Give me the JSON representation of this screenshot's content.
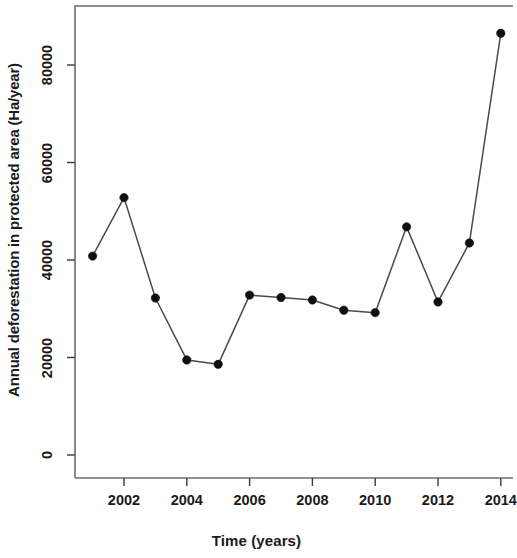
{
  "chart_data": {
    "type": "line",
    "title": "",
    "xlabel": "Time (years)",
    "ylabel": "Annual deforestation in protected area (Ha/year)",
    "x": [
      2001,
      2002,
      2003,
      2004,
      2005,
      2006,
      2007,
      2008,
      2009,
      2010,
      2011,
      2012,
      2013,
      2014
    ],
    "values": [
      40800,
      52800,
      32200,
      19500,
      18600,
      32800,
      32300,
      31800,
      29700,
      29200,
      46800,
      31400,
      43500,
      86500
    ],
    "series": [
      {
        "name": "Annual deforestation in protected area",
        "values": [
          40800,
          52800,
          32200,
          19500,
          18600,
          32800,
          32300,
          31800,
          29700,
          29200,
          46800,
          31400,
          43500,
          86500
        ]
      }
    ],
    "xlim": [
      2000.6,
      2014.2
    ],
    "ylim": [
      0,
      90000
    ],
    "xticks": [
      2002,
      2004,
      2006,
      2008,
      2010,
      2012,
      2014
    ],
    "xtick_labels": [
      "2002",
      "2004",
      "2006",
      "2008",
      "2010",
      "2012",
      "2014"
    ],
    "yticks": [
      0,
      20000,
      40000,
      60000,
      80000
    ],
    "ytick_labels": [
      "0",
      "20000",
      "40000",
      "60000",
      "80000"
    ],
    "grid": false,
    "legend": false,
    "marker": "filled-circle",
    "line_color": "#4a4a4a",
    "point_color": "#101010"
  },
  "axes": {
    "x_title": "Time (years)",
    "y_title": "Annual deforestation in protected area (Ha/year)"
  }
}
